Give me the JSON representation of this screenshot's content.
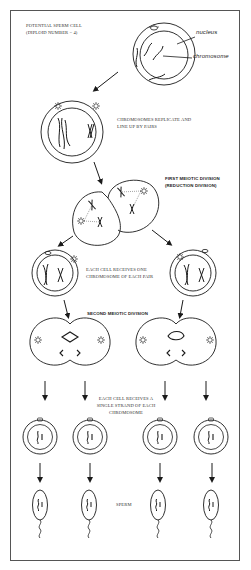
{
  "diagram": {
    "labels": {
      "potential_cell_line1": "POTENTIAL SPERM CELL",
      "potential_cell_line2": "(DIPLOID NUMBER = 4)",
      "nucleus": "nucleus",
      "chromosome": "chromosome",
      "replicate_line1": "CHROMOSOMES REPLICATE AND",
      "replicate_line2": "LINE UP BY PAIRS",
      "first_division_line1": "FIRST MEIOTIC DIVISION",
      "first_division_line2": "(REDUCTION DIVISION)",
      "each_cell_one_line1": "EACH CELL RECEIVES ONE",
      "each_cell_one_line2": "CHROMOSOME OF EACH PAIR",
      "second_division": "SECOND MEIOTIC DIVISION",
      "single_strand_line1": "EACH CELL RECEIVES A",
      "single_strand_line2": "SINGLE STRAND OF EACH",
      "single_strand_line3": "CHROMOSOME",
      "sperm": "SPERM"
    },
    "stages": [
      "potential-sperm-cell",
      "replicated-chromosomes-cell",
      "first-meiotic-division",
      "two-daughter-cells",
      "second-meiotic-division",
      "four-haploid-cells",
      "four-sperm"
    ],
    "colors": {
      "line": "#1a1a1a",
      "frame": "#555555",
      "background": "#ffffff"
    }
  }
}
